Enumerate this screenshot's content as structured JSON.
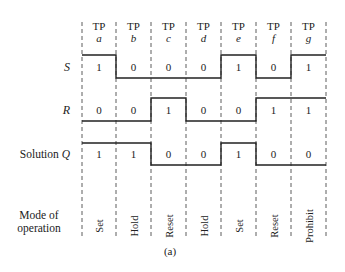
{
  "timing_points": [
    {
      "label": "TP",
      "letter": "a",
      "S": "1",
      "R": "0",
      "Q": "1",
      "mode": "Set"
    },
    {
      "label": "TP",
      "letter": "b",
      "S": "0",
      "R": "0",
      "Q": "1",
      "mode": "Hold"
    },
    {
      "label": "TP",
      "letter": "c",
      "S": "0",
      "R": "1",
      "Q": "0",
      "mode": "Reset"
    },
    {
      "label": "TP",
      "letter": "d",
      "S": "0",
      "R": "0",
      "Q": "0",
      "mode": "Hold"
    },
    {
      "label": "TP",
      "letter": "e",
      "S": "1",
      "R": "0",
      "Q": "1",
      "mode": "Set"
    },
    {
      "label": "TP",
      "letter": "f",
      "S": "0",
      "R": "1",
      "Q": "0",
      "mode": "Reset"
    },
    {
      "label": "TP",
      "letter": "g",
      "S": "1",
      "R": "1",
      "Q": "0",
      "mode": "Prohibit"
    }
  ],
  "rows": {
    "S": "S",
    "R": "R",
    "Q_prefix": "Solution ",
    "Q": "Q",
    "mode_line1": "Mode of",
    "mode_line2": "operation"
  },
  "caption": "(a)"
}
